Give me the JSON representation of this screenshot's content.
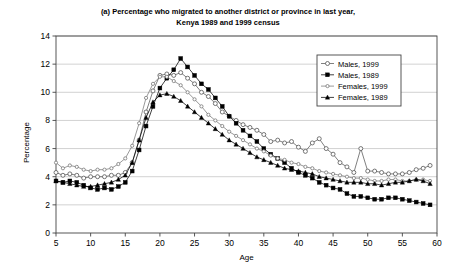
{
  "chart_data": {
    "type": "line",
    "title": "(a) Percentage who migrated to another district or province in last year, Kenya 1989 and 1999 census",
    "title_line1": "(a) Percentage who migrated to another district or province in last year,",
    "title_line2": "Kenya 1989 and 1999 census",
    "xlabel": "Age",
    "ylabel": "Percentage",
    "xlim": [
      5,
      60
    ],
    "ylim": [
      0,
      14
    ],
    "xticks": [
      5,
      10,
      15,
      20,
      25,
      30,
      35,
      40,
      45,
      50,
      55,
      60
    ],
    "yticks": [
      0,
      2,
      4,
      6,
      8,
      10,
      12,
      14
    ],
    "grid": "horizontal",
    "legend_position": "upper-right",
    "x": [
      5,
      6,
      7,
      8,
      9,
      10,
      11,
      12,
      13,
      14,
      15,
      16,
      17,
      18,
      19,
      20,
      21,
      22,
      23,
      24,
      25,
      26,
      27,
      28,
      29,
      30,
      31,
      32,
      33,
      34,
      35,
      36,
      37,
      38,
      39,
      40,
      41,
      42,
      43,
      44,
      45,
      46,
      47,
      48,
      49,
      50,
      51,
      52,
      53,
      54,
      55,
      56,
      57,
      58,
      59
    ],
    "series": [
      {
        "name": "Males, 1999",
        "marker": "open-circle",
        "color": "#555555",
        "values": [
          4.3,
          4.1,
          4.2,
          4.1,
          3.9,
          4.0,
          4.0,
          4.0,
          4.1,
          4.1,
          4.3,
          5.0,
          6.6,
          8.6,
          10.1,
          11.2,
          11.3,
          11.2,
          11.4,
          11.0,
          10.6,
          10.0,
          9.7,
          9.2,
          8.6,
          8.3,
          8.0,
          7.7,
          7.5,
          7.3,
          7.0,
          6.5,
          6.6,
          6.4,
          6.5,
          6.1,
          5.8,
          6.4,
          6.7,
          6.0,
          5.6,
          5.0,
          4.7,
          4.3,
          6.0,
          4.4,
          4.4,
          4.3,
          4.2,
          4.2,
          4.2,
          4.3,
          4.5,
          4.6,
          4.8
        ]
      },
      {
        "name": "Males, 1989",
        "marker": "filled-square",
        "color": "#000000",
        "values": [
          3.7,
          3.6,
          3.7,
          3.6,
          3.4,
          3.2,
          3.1,
          3.2,
          3.1,
          3.3,
          3.6,
          4.4,
          5.9,
          7.6,
          9.0,
          10.3,
          11.0,
          11.6,
          12.4,
          11.8,
          11.2,
          10.6,
          10.2,
          9.6,
          9.0,
          8.3,
          7.8,
          7.3,
          6.9,
          6.5,
          6.0,
          5.6,
          5.3,
          5.0,
          4.6,
          4.3,
          4.1,
          3.9,
          3.6,
          3.4,
          3.2,
          3.1,
          2.8,
          2.6,
          2.6,
          2.5,
          2.4,
          2.4,
          2.5,
          2.5,
          2.4,
          2.3,
          2.2,
          2.1,
          2.0
        ]
      },
      {
        "name": "Females, 1999",
        "marker": "open-circle-small",
        "color": "#777777",
        "values": [
          5.0,
          4.6,
          4.8,
          4.7,
          4.5,
          4.4,
          4.5,
          4.5,
          4.6,
          4.9,
          5.3,
          6.2,
          7.8,
          9.6,
          10.6,
          11.1,
          11.1,
          10.8,
          10.5,
          10.0,
          9.5,
          9.0,
          8.4,
          8.0,
          7.6,
          7.2,
          6.9,
          6.6,
          6.3,
          6.0,
          5.8,
          5.5,
          5.3,
          5.2,
          5.0,
          4.9,
          4.7,
          4.6,
          4.4,
          4.3,
          4.2,
          4.1,
          4.0,
          3.9,
          3.9,
          3.8,
          3.7,
          3.7,
          3.8,
          3.8,
          3.7,
          3.7,
          3.8,
          3.8,
          3.7
        ]
      },
      {
        "name": "Females, 1989",
        "marker": "filled-triangle",
        "color": "#000000",
        "values": [
          3.7,
          3.6,
          3.5,
          3.4,
          3.3,
          3.3,
          3.4,
          3.5,
          3.6,
          3.8,
          4.1,
          5.0,
          6.6,
          8.2,
          9.3,
          9.8,
          9.9,
          9.7,
          9.4,
          9.0,
          8.6,
          8.2,
          7.8,
          7.4,
          7.0,
          6.6,
          6.3,
          6.0,
          5.7,
          5.4,
          5.2,
          5.0,
          4.8,
          4.6,
          4.5,
          4.4,
          4.3,
          4.2,
          4.0,
          3.9,
          3.8,
          3.7,
          3.6,
          3.6,
          3.6,
          3.5,
          3.5,
          3.4,
          3.5,
          3.6,
          3.6,
          3.7,
          3.8,
          3.7,
          3.5
        ]
      }
    ]
  },
  "legend": {
    "items": [
      {
        "label": "Males, 1999"
      },
      {
        "label": "Males, 1989"
      },
      {
        "label": "Females, 1999"
      },
      {
        "label": "Females, 1989"
      }
    ]
  }
}
